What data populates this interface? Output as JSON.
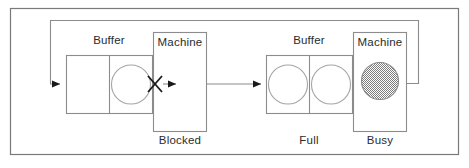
{
  "diagram": {
    "type": "flow",
    "title": "",
    "frame": {
      "stroke": "#7a7a7a",
      "x": 10,
      "y": 8,
      "width": 449,
      "height": 147
    },
    "palette": {
      "line": "#8c8c8c",
      "box_stroke": "#8c8c8c",
      "arrow_fill": "#1a1a1a",
      "text": "#2b2b2b",
      "busy_circle_fill": "#9a9a9a",
      "background": "#ffffff"
    },
    "stations": [
      {
        "id": "station-left",
        "buffer": {
          "label": "Buffer",
          "label_position": "above",
          "cells": 2,
          "occupied": [
            false,
            true
          ],
          "state_label": ""
        },
        "machine": {
          "label": "Machine",
          "label_position": "inside-top",
          "state_label": "Blocked",
          "state_label_position": "below",
          "content": "none",
          "blocked_marker": "X"
        }
      },
      {
        "id": "station-right",
        "buffer": {
          "label": "Buffer",
          "label_position": "above",
          "cells": 2,
          "occupied": [
            true,
            true
          ],
          "state_label": "Full"
        },
        "machine": {
          "label": "Machine",
          "label_position": "inside-top",
          "state_label": "Busy",
          "state_label_position": "below",
          "content": "hatched-circle",
          "blocked_marker": ""
        }
      }
    ],
    "connectors": [
      {
        "id": "feedback-loop",
        "kind": "recirculation",
        "from": "station-right-machine-out",
        "to": "station-left-buffer-in",
        "arrow": true
      },
      {
        "id": "inter-station-flow",
        "kind": "transfer",
        "from": "station-left-machine-out",
        "to": "station-right-buffer-in",
        "arrow": true
      },
      {
        "id": "left-machine-out-stub",
        "kind": "output",
        "from": "station-left-buffer-out",
        "to": "station-left-machine",
        "arrow": true
      }
    ]
  },
  "labels": {
    "buffer_left": "Buffer",
    "machine_left": "Machine",
    "blocked": "Blocked",
    "buffer_right": "Buffer",
    "machine_right": "Machine",
    "full": "Full",
    "busy": "Busy"
  }
}
